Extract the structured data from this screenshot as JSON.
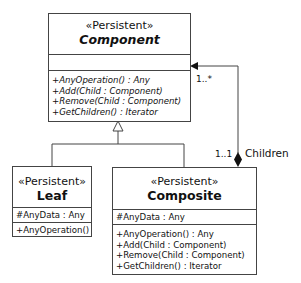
{
  "diagram": {
    "type": "UML class diagram",
    "pattern": "Composite",
    "classes": {
      "component": {
        "stereotype": "«Persistent»",
        "name": "Component",
        "abstract": true,
        "attributes": [],
        "operations": [
          "+AnyOperation() : Any",
          "+Add(Child : Component)",
          "+Remove(Child : Component)",
          "+GetChildren() : Iterator"
        ]
      },
      "leaf": {
        "stereotype": "«Persistent»",
        "name": "Leaf",
        "abstract": false,
        "attributes": [
          "#AnyData : Any"
        ],
        "operations": [
          "+AnyOperation()"
        ]
      },
      "composite": {
        "stereotype": "«Persistent»",
        "name": "Composite",
        "abstract": false,
        "attributes": [
          "#AnyData : Any"
        ],
        "operations": [
          "+AnyOperation() : Any",
          "+Add(Child : Component)",
          "+Remove(Child : Component)",
          "+GetChildren() : Iterator"
        ]
      }
    },
    "relationships": {
      "generalization": {
        "parent": "Component",
        "children": [
          "Leaf",
          "Composite"
        ]
      },
      "composition": {
        "whole": "Composite",
        "part": "Component",
        "role": "Children",
        "whole_multiplicity": "1..1",
        "part_multiplicity": "1..*"
      }
    }
  }
}
